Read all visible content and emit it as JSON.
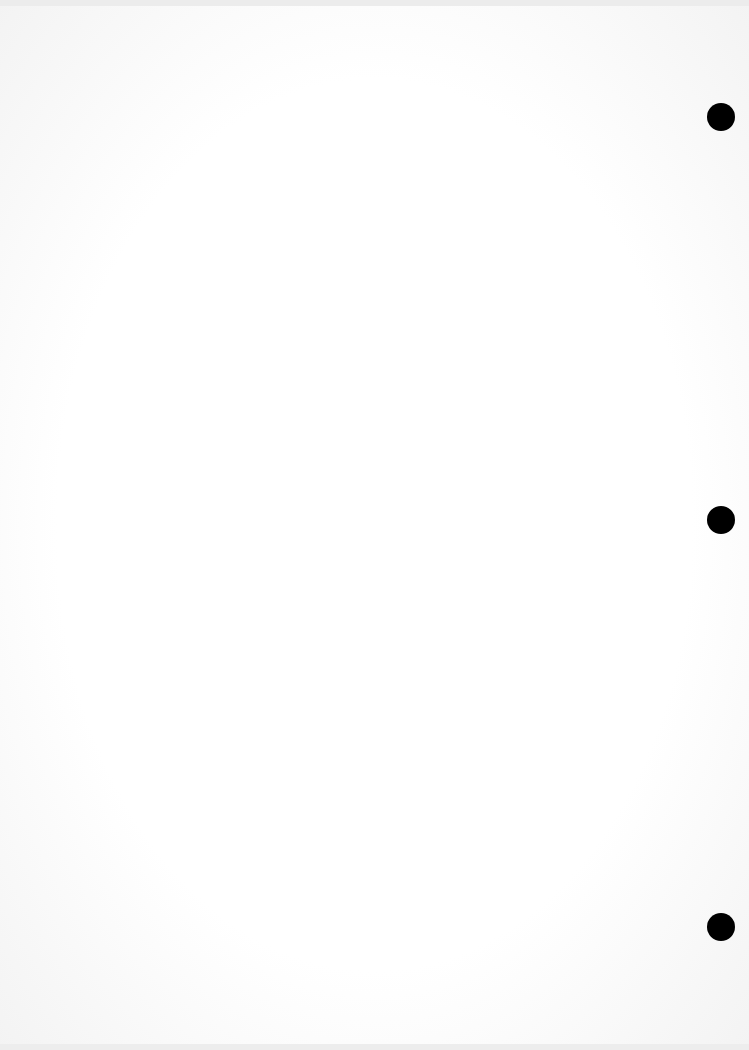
{
  "document": {
    "type": "scanned blank page",
    "bleed_through_lines": [
      "",
      "",
      ""
    ],
    "punch_holes": [
      {
        "top": 103
      },
      {
        "top": 506
      },
      {
        "top": 913
      }
    ]
  }
}
